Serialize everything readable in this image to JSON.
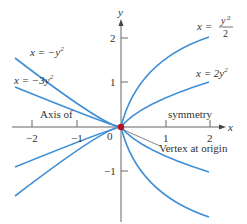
{
  "axes": {
    "x_label": "x",
    "y_label": "y",
    "x_ticks": [
      "−2",
      "−1",
      "1",
      "2"
    ],
    "y_ticks": [
      "2",
      "1",
      "−1"
    ],
    "origin_label": "0"
  },
  "curves": [
    {
      "label_lhs": "x = −y",
      "label_sup": "2",
      "equation": "x = -y^2",
      "coef": -1
    },
    {
      "label_lhs": "x = −3y",
      "label_sup": "2",
      "equation": "x = -3y^2",
      "coef": -3
    },
    {
      "label_lhs": "x = ",
      "label_num": "y",
      "label_sup": "2",
      "label_den": "2",
      "equation": "x = y^2/2",
      "coef": 0.5
    },
    {
      "label_lhs": "x = 2y",
      "label_sup": "2",
      "equation": "x = 2y^2",
      "coef": 2
    }
  ],
  "annotations": {
    "axis_left": "Axis of",
    "axis_right": "symmetry",
    "vertex": "Vertex at origin"
  },
  "colors": {
    "curve": "#3f8fd6",
    "axis": "#666666",
    "vertex": "#b3121f"
  }
}
